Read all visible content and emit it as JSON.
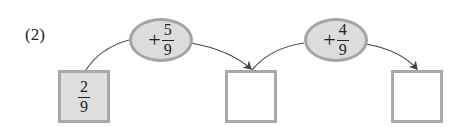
{
  "problem_label": "(2)",
  "diagram": {
    "start": {
      "numerator": "2",
      "denominator": "9",
      "filled": true
    },
    "steps": [
      {
        "operator": "+",
        "numerator": "5",
        "denominator": "9"
      },
      {
        "operator": "+",
        "numerator": "4",
        "denominator": "9"
      }
    ],
    "answer_boxes": [
      {
        "value": ""
      },
      {
        "value": ""
      }
    ]
  },
  "colors": {
    "box_border": "#a8a8a8",
    "box_fill": "#dedede",
    "oval_fill": "#dcdcdc",
    "arrow": "#444444"
  }
}
